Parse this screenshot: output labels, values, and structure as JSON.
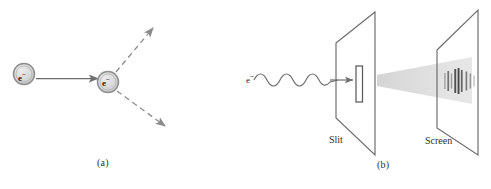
{
  "figure": {
    "background_color": "#ffffff",
    "line_color": "#6b6b6b",
    "dark_line_color": "#4a4a4a",
    "fill_gray": "#cfcfcf",
    "beam_gray": "#d8d8d8",
    "fringe_gray": "#5a5a5a"
  },
  "panel_a": {
    "caption": "(a)",
    "incoming_particle_label": "e",
    "incoming_particle_charge": "−",
    "scattering_particle_label": "e",
    "scattering_particle_charge": "−",
    "incoming_arrow": {
      "x1": 33,
      "y1": 79,
      "x2": 97,
      "y2": 79,
      "style": "solid"
    },
    "outgoing_arrows": [
      {
        "name": "upper-scatter-arrow",
        "x1": 115,
        "y1": 73,
        "x2": 154,
        "y2": 27,
        "style": "dashed"
      },
      {
        "name": "lower-scatter-arrow",
        "x1": 117,
        "y1": 91,
        "x2": 166,
        "y2": 127,
        "style": "dashed"
      }
    ],
    "particles": [
      {
        "name": "incoming-electron",
        "cx": 24,
        "cy": 74,
        "r": 11
      },
      {
        "name": "target-electron",
        "cx": 108,
        "cy": 82,
        "r": 11
      }
    ]
  },
  "panel_b": {
    "caption": "(b)",
    "beam_label": "e",
    "beam_charge": "−",
    "slit_label": "Slit",
    "screen_label": "Screen",
    "wave": {
      "x_start": 254,
      "x_end": 338,
      "y": 80,
      "cycles": 5,
      "amplitude": 4
    },
    "slit_plate": {
      "name": "slit-plate",
      "points": "336,43 375,12 375,155 336,118"
    },
    "slit_aperture": {
      "name": "slit-aperture",
      "x": 356,
      "y": 66,
      "width": 7,
      "height": 36
    },
    "screen_plate": {
      "name": "screen-plate",
      "points": "437,50 478,10 478,155 437,128"
    },
    "diffraction_cone": {
      "points": "378,76 378,85 470,104 470,58"
    },
    "fringes": [
      {
        "x": 445,
        "height": 16,
        "opacity": 0.45,
        "width": 1.4
      },
      {
        "x": 448,
        "height": 20,
        "opacity": 0.7,
        "width": 1.6
      },
      {
        "x": 451,
        "height": 15,
        "opacity": 0.5,
        "width": 1.4
      },
      {
        "x": 455,
        "height": 24,
        "opacity": 0.85,
        "width": 1.8
      },
      {
        "x": 458,
        "height": 26,
        "opacity": 0.9,
        "width": 1.8
      },
      {
        "x": 461,
        "height": 22,
        "opacity": 0.8,
        "width": 1.6
      },
      {
        "x": 466,
        "height": 19,
        "opacity": 0.7,
        "width": 1.6
      },
      {
        "x": 470,
        "height": 15,
        "opacity": 0.55,
        "width": 1.4
      },
      {
        "x": 474,
        "height": 11,
        "opacity": 0.4,
        "width": 1.3
      }
    ]
  }
}
